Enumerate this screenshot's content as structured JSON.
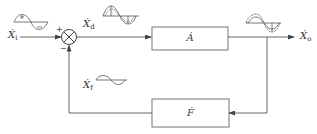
{
  "diagram": {
    "type": "negative-feedback-block-diagram",
    "signals": {
      "input": {
        "symbol": "Ẋ",
        "sub": "i"
      },
      "error": {
        "symbol": "Ẋ",
        "sub": "d"
      },
      "output": {
        "symbol": "Ẋ",
        "sub": "o"
      },
      "feedback": {
        "symbol": "Ẋ",
        "sub": "f"
      }
    },
    "summing_junction": {
      "plus_sign": "+",
      "minus_sign": "−"
    },
    "blocks": {
      "forward": {
        "label": "Ȧ"
      },
      "feedback": {
        "label": "Ḟ"
      }
    },
    "waveforms": {
      "input": "clean sine with + and − half-cycle marks",
      "error": "distorted sine (pre-distorted)",
      "output": "corrected sine (dashed)",
      "feedback": "sine wave"
    },
    "line_color": "#555555"
  }
}
